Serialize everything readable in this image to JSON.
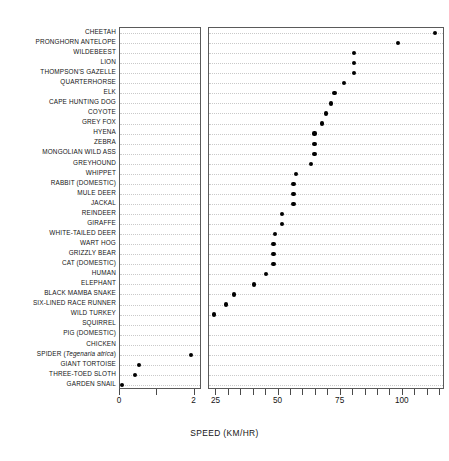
{
  "chart_data": {
    "type": "scatter",
    "title": "",
    "subtitle": "",
    "xlabel": "SPEED (KM/HR)",
    "ylabel": "",
    "grid": "dotted horizontal rows",
    "legend": "none",
    "orientation": "horizontal dot plot, categories on y-axis",
    "broken_axis": true,
    "panels": [
      {
        "name": "left-panel",
        "xlim": [
          0,
          2.2
        ],
        "ticks": [
          0,
          1,
          2
        ],
        "tick_labels": [
          "0",
          "",
          "2"
        ]
      },
      {
        "name": "right-panel",
        "xlim": [
          22,
          117
        ],
        "ticks": [
          25,
          30,
          35,
          40,
          45,
          50,
          55,
          60,
          65,
          70,
          75,
          80,
          85,
          90,
          95,
          100,
          105,
          110,
          115
        ],
        "tick_labels": [
          "25",
          "",
          "",
          "",
          "",
          "50",
          "",
          "",
          "",
          "",
          "75",
          "",
          "",
          "",
          "",
          "100",
          "",
          "",
          ""
        ]
      }
    ],
    "categories": [
      "CHEETAH",
      "PRONGHORN ANTELOPE",
      "WILDEBEEST",
      "LION",
      "THOMPSON'S GAZELLE",
      "QUARTERHORSE",
      "ELK",
      "CAPE HUNTING DOG",
      "COYOTE",
      "GREY FOX",
      "HYENA",
      "ZEBRA",
      "MONGOLIAN WILD ASS",
      "GREYHOUND",
      "WHIPPET",
      "RABBIT (DOMESTIC)",
      "MULE DEER",
      "JACKAL",
      "REINDEER",
      "GIRAFFE",
      "WHITE-TAILED DEER",
      "WART HOG",
      "GRIZZLY BEAR",
      "CAT (DOMESTIC)",
      "HUMAN",
      "ELEPHANT",
      "BLACK MAMBA SNAKE",
      "SIX-LINED RACE RUNNER",
      "WILD TURKEY",
      "SQUIRREL",
      "PIG (DOMESTIC)",
      "CHICKEN",
      "SPIDER (Tegenaria atrica)",
      "GIANT TORTOISE",
      "THREE-TOED SLOTH",
      "GARDEN SNAIL"
    ],
    "values": [
      113.0,
      98.0,
      80.5,
      80.5,
      80.5,
      76.5,
      72.5,
      71.0,
      69.0,
      67.5,
      64.5,
      64.5,
      64.5,
      63.0,
      57.0,
      56.0,
      56.0,
      56.0,
      51.5,
      51.5,
      48.5,
      48.0,
      48.0,
      48.0,
      45.0,
      40.0,
      32.0,
      29.0,
      24.0,
      19.0,
      18.0,
      14.5,
      1.9,
      0.5,
      0.4,
      0.05
    ],
    "point_panel": [
      "right",
      "right",
      "right",
      "right",
      "right",
      "right",
      "right",
      "right",
      "right",
      "right",
      "right",
      "right",
      "right",
      "right",
      "right",
      "right",
      "right",
      "right",
      "right",
      "right",
      "right",
      "right",
      "right",
      "right",
      "right",
      "right",
      "right",
      "right",
      "right",
      "right",
      "right",
      "right",
      "left",
      "left",
      "left",
      "left"
    ],
    "units": "km/hr",
    "marker": "filled circle",
    "marker_color": "#000000",
    "axis_color": "#5a5a5a",
    "grid_color": "#c9c9c9"
  },
  "axis": {
    "left_tick_labels": [
      {
        "v": 0,
        "text": "0"
      },
      {
        "v": 2,
        "text": "2"
      }
    ],
    "right_tick_labels": [
      {
        "v": 25,
        "text": "25"
      },
      {
        "v": 50,
        "text": "50"
      },
      {
        "v": 75,
        "text": "75"
      },
      {
        "v": 100,
        "text": "100"
      }
    ],
    "xlabel": "SPEED (KM/HR)"
  }
}
